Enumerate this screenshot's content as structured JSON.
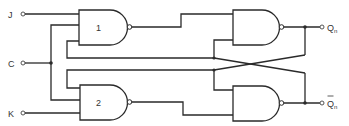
{
  "diagram": {
    "type": "JK flip-flop logic circuit (NAND gates)",
    "inputs": [
      {
        "id": "J",
        "label": "J"
      },
      {
        "id": "C",
        "label": "C"
      },
      {
        "id": "K",
        "label": "K"
      }
    ],
    "outputs": [
      {
        "id": "Qn",
        "label": "Q",
        "subscript": "n",
        "overbar": false
      },
      {
        "id": "Qn_bar",
        "label": "Q",
        "subscript": "n",
        "overbar": true
      }
    ],
    "gates": [
      {
        "id": "gate1",
        "kind": "NAND",
        "label": "1"
      },
      {
        "id": "gate2",
        "kind": "NAND",
        "label": "2"
      },
      {
        "id": "gate3",
        "kind": "NAND",
        "label": ""
      },
      {
        "id": "gate4",
        "kind": "NAND",
        "label": ""
      }
    ],
    "colors": {
      "line": "#2a2a2a",
      "background": "#ffffff",
      "text": "#333333"
    }
  }
}
